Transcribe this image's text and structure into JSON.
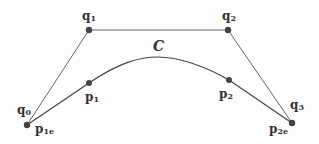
{
  "colors": {
    "background": "#fdfdfd",
    "line": "#555555",
    "curve": "#444444",
    "point": "#444444",
    "text": "#333333"
  },
  "curve_label": "C",
  "control_points": [
    {
      "id": "q0",
      "base": "q",
      "sub": "0",
      "x": 27,
      "y": 125
    },
    {
      "id": "q1",
      "base": "q",
      "sub": "1",
      "x": 89,
      "y": 30
    },
    {
      "id": "q2",
      "base": "q",
      "sub": "2",
      "x": 228,
      "y": 30
    },
    {
      "id": "q3",
      "base": "q",
      "sub": "3",
      "x": 292,
      "y": 123
    }
  ],
  "curve_points": [
    {
      "id": "p1e",
      "base": "p",
      "sub": "1e",
      "x": 27,
      "y": 125
    },
    {
      "id": "p1",
      "base": "p",
      "sub": "1",
      "x": 89,
      "y": 83
    },
    {
      "id": "p2",
      "base": "p",
      "sub": "2",
      "x": 229,
      "y": 80
    },
    {
      "id": "p2e",
      "base": "p",
      "sub": "2e",
      "x": 292,
      "y": 123
    }
  ],
  "labels": {
    "q0": {
      "base": "q",
      "sub": "0"
    },
    "q1": {
      "base": "q",
      "sub": "1"
    },
    "q2": {
      "base": "q",
      "sub": "2"
    },
    "q3": {
      "base": "q",
      "sub": "3"
    },
    "p1": {
      "base": "p",
      "sub": "1"
    },
    "p2": {
      "base": "p",
      "sub": "2"
    },
    "p1e": {
      "base": "p",
      "sub": "1e"
    },
    "p2e": {
      "base": "p",
      "sub": "2e"
    },
    "C": "C"
  }
}
